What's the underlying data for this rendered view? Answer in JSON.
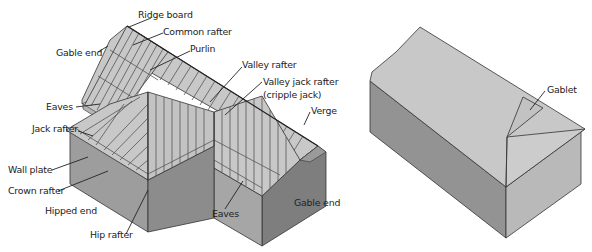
{
  "figure": {
    "left_diagram": {
      "name": "Roof terminology (gable, hip and valley)",
      "labels": {
        "ridge_board": "Ridge board",
        "common_rafter": "Common rafter",
        "gable_end_top": "Gable end",
        "purlin": "Purlin",
        "valley_rafter": "Valley rafter",
        "valley_jack_rafter": "Valley jack rafter",
        "cripple_jack": "(cripple jack)",
        "eaves_top": "Eaves",
        "verge": "Verge",
        "jack_rafter": "Jack rafter",
        "wall_plate": "Wall plate",
        "crown_rafter": "Crown rafter",
        "hipped_end": "Hipped end",
        "hip_rafter": "Hip rafter",
        "eaves_bottom": "Eaves",
        "gable_end_bottom": "Gable end"
      }
    },
    "right_diagram": {
      "name": "Gablet roof",
      "labels": {
        "gablet": "Gablet"
      }
    },
    "colors": {
      "roof": "#c8c8c8",
      "wall_dark": "#8f8f8f",
      "wall_mid": "#a6a6a6",
      "wall_light": "#b9b9b9",
      "gable_dark": "#7e7e7e",
      "lines": "#333333"
    }
  }
}
